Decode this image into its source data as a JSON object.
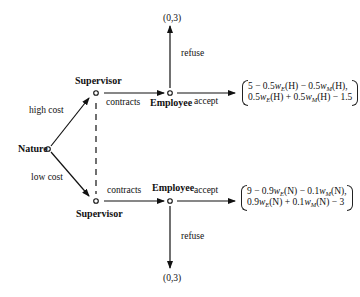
{
  "diagram": {
    "type": "extensive-form game tree",
    "nodes": {
      "nature": {
        "label": "Nature"
      },
      "supervisor_high": {
        "label": "Supervisor"
      },
      "supervisor_low": {
        "label": "Supervisor"
      },
      "employee_high": {
        "label": "Employee"
      },
      "employee_low": {
        "label": "Employee"
      }
    },
    "edges": {
      "high_cost": "high cost",
      "low_cost": "low cost",
      "contracts_high": "contracts",
      "contracts_low": "contracts",
      "accept_high": "accept",
      "accept_low": "accept",
      "refuse_high": "refuse",
      "refuse_low": "refuse"
    },
    "terminals": {
      "refuse_high_payoff": "(0,3)",
      "refuse_low_payoff": "(0,3)",
      "accept_high_payoff": {
        "line1": {
          "a": "5 − 0.5",
          "b": "w",
          "c": "E",
          "d": "(H) − 0.5",
          "e": "w",
          "f": "M",
          "g": "(H),"
        },
        "line2": {
          "a": "0.5",
          "b": "w",
          "c": "E",
          "d": "(H) + 0.5",
          "e": "w",
          "f": "M",
          "g": "(H) − 1.5"
        }
      },
      "accept_low_payoff": {
        "line1": {
          "a": "9 − 0.9",
          "b": "w",
          "c": "E",
          "d": "(N) − 0.1",
          "e": "w",
          "f": "M",
          "g": "(N),"
        },
        "line2": {
          "a": "0.9",
          "b": "w",
          "c": "E",
          "d": "(N) + 0.1",
          "e": "w",
          "f": "M",
          "g": "(N) − 3"
        }
      }
    },
    "info_set": "dashed line connecting the two Supervisor nodes"
  }
}
